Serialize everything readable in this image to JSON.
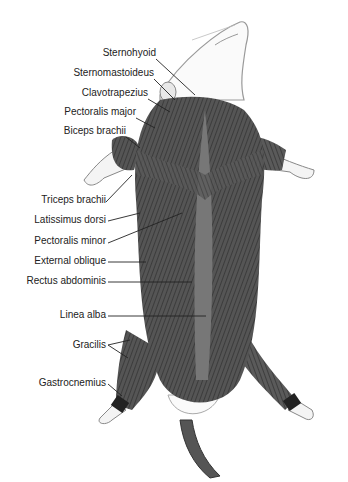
{
  "figure": {
    "labels": [
      {
        "id": "sternohyoid",
        "text": "Sternohyoid",
        "x": 156,
        "y": 53,
        "tx": 195,
        "ty": 95
      },
      {
        "id": "sternomastoideus",
        "text": "Sternomastoideus",
        "x": 154,
        "y": 73,
        "tx": 175,
        "ty": 100
      },
      {
        "id": "clavotrapezius",
        "text": "Clavotrapezius",
        "x": 148,
        "y": 93,
        "tx": 170,
        "ty": 110
      },
      {
        "id": "pectoralis-major",
        "text": "Pectoralis major",
        "x": 136,
        "y": 112,
        "tx": 155,
        "ty": 125
      },
      {
        "id": "biceps-brachii",
        "text": "Biceps brachii",
        "x": 126,
        "y": 131,
        "tx": 140,
        "ty": 145
      },
      {
        "id": "triceps-brachii",
        "text": "Triceps brachii",
        "x": 106,
        "y": 200,
        "tx": 132,
        "ty": 175
      },
      {
        "id": "latissimus-dorsi",
        "text": "Latissimus dorsi",
        "x": 106,
        "y": 218,
        "tx": 140,
        "ty": 213
      },
      {
        "id": "pectoralis-minor",
        "text": "Pectoralis minor",
        "x": 106,
        "y": 240,
        "tx": 182,
        "ty": 212
      },
      {
        "id": "external-oblique",
        "text": "External oblique",
        "x": 106,
        "y": 259,
        "tx": 146,
        "ty": 261
      },
      {
        "id": "rectus-abdominis",
        "text": "Rectus abdominis",
        "x": 106,
        "y": 279,
        "tx": 192,
        "ty": 281
      },
      {
        "id": "linea-alba",
        "text": "Linea alba",
        "x": 106,
        "y": 312,
        "tx": 206,
        "ty": 315
      },
      {
        "id": "gracilis",
        "text": "Gracilis",
        "x": 106,
        "y": 342,
        "tx": 130,
        "ty": 340,
        "tx2": 128,
        "ty2": 358
      },
      {
        "id": "gastrocnemius",
        "text": "Gastrocnemius",
        "x": 106,
        "y": 380,
        "tx": 122,
        "ty": 394
      }
    ]
  }
}
